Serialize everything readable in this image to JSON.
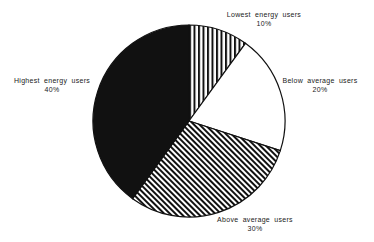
{
  "chart_data": {
    "type": "pie",
    "title": "",
    "start_angle_deg": 0,
    "direction": "clockwise",
    "slices": [
      {
        "label": "Lowest energy users",
        "value": 10,
        "value_label": "10%",
        "fill": "vertical-stripes"
      },
      {
        "label": "Below average users",
        "value": 20,
        "value_label": "20%",
        "fill": "white"
      },
      {
        "label": "Above average users",
        "value": 30,
        "value_label": "30%",
        "fill": "diagonal-stripes"
      },
      {
        "label": "Highest energy users",
        "value": 40,
        "value_label": "40%",
        "fill": "black"
      }
    ],
    "colors": {
      "stroke": "#111111",
      "dark": "#111111",
      "background": "#ffffff"
    }
  },
  "labels": {
    "lowest": {
      "name": "Lowest energy users",
      "pct": "10%"
    },
    "below": {
      "name": "Below average users",
      "pct": "20%"
    },
    "above": {
      "name": "Above average users",
      "pct": "30%"
    },
    "highest": {
      "name": "Highest energy users",
      "pct": "40%"
    }
  }
}
